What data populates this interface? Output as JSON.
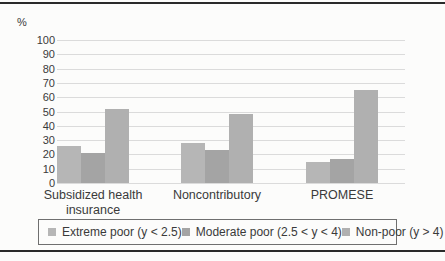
{
  "chart_data": {
    "type": "bar",
    "categories": [
      "Subsidized health insurance",
      "Noncontributory",
      "PROMESE"
    ],
    "series": [
      {
        "name": "Extreme poor (y < 2.5)",
        "color": "#b6b6b6",
        "values": [
          26,
          28,
          15
        ]
      },
      {
        "name": "Moderate poor (2.5 < y < 4)",
        "color": "#a4a4a4",
        "values": [
          21,
          23,
          17
        ]
      },
      {
        "name": "Non-poor (y > 4)",
        "color": "#b0b0b0",
        "values": [
          52,
          48,
          65
        ]
      }
    ],
    "ylabel": "%",
    "ylim": [
      0,
      100
    ],
    "yticks": [
      100,
      90,
      80,
      70,
      60,
      50,
      40,
      30,
      20,
      10,
      0
    ],
    "grid": true,
    "legend_position": "bottom",
    "colors": {
      "gridline": "#dbdbdb",
      "text": "#3a3a3a",
      "rule": "#2a2a2a",
      "legend_border": "#6f6f6f",
      "background": "#fcfcfb"
    }
  }
}
